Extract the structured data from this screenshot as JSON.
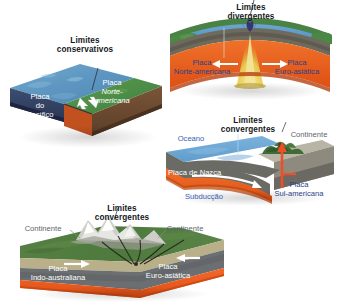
{
  "figure": {
    "title_text": "Tipos de limites de placas tectónicas",
    "background": "#ffffff"
  },
  "panels": [
    {
      "id": "conservative",
      "name": "conservative-boundary-block",
      "title_line1": "Limites",
      "title_line2": "conservativos",
      "labels": [
        {
          "name": "plate-label-pacific",
          "text": "Placa",
          "style": "white"
        },
        {
          "name": "plate-label-pacific-2",
          "text": "do",
          "style": "white"
        },
        {
          "name": "plate-label-pacific-3",
          "text": "Pacífico",
          "style": "white"
        },
        {
          "name": "plate-label-north-american",
          "text": "Placa",
          "style": "white"
        },
        {
          "name": "plate-label-north-american-2",
          "text": "Norte-",
          "style": "white-italic"
        },
        {
          "name": "plate-label-north-american-3",
          "text": "americana",
          "style": "white-italic"
        }
      ],
      "colors": {
        "ocean": "#5d97c2",
        "land": "#4f8f4a",
        "mantle": "#2e3a5c",
        "crust": "#6b4a32",
        "magma": "#d4561f"
      }
    },
    {
      "id": "divergent",
      "name": "divergent-boundary-block",
      "title_line1": "Limites",
      "title_line2": "divergentes",
      "labels": [
        {
          "name": "plate-label-north-american",
          "text": "Placa",
          "style": "blue"
        },
        {
          "name": "plate-label-north-american-2",
          "text": "Norte-americana",
          "style": "blue"
        },
        {
          "name": "plate-label-euro-asian",
          "text": "Placa",
          "style": "blue"
        },
        {
          "name": "plate-label-euro-asian-2",
          "text": "Euro-asiática",
          "style": "blue"
        }
      ],
      "arrows": [
        "arrow-left",
        "arrow-right"
      ],
      "colors": {
        "ocean": "#5f9ecb",
        "land": "#4a8246",
        "mantle": "#6e6a5c",
        "asthenosphere": "#e8611e",
        "magma": "#e8d15a"
      }
    },
    {
      "id": "convergent-ocean",
      "name": "convergent-ocean-continent-block",
      "title_line1": "Limites",
      "title_line2": "convergentes",
      "labels": [
        {
          "name": "label-ocean",
          "text": "Oceano",
          "style": "blue-light"
        },
        {
          "name": "label-continent",
          "text": "Continente",
          "style": "gray"
        },
        {
          "name": "plate-label-nazca",
          "text": "Placa de Nazca",
          "style": "white"
        },
        {
          "name": "label-subduction",
          "text": "Subducção",
          "style": "blue-light"
        },
        {
          "name": "plate-label-south-american",
          "text": "Placa",
          "style": "blue"
        },
        {
          "name": "plate-label-south-american-2",
          "text": "Sul-americana",
          "style": "blue"
        }
      ],
      "colors": {
        "ocean": "#6fa8d6",
        "continent": "#b8b4a6",
        "mantle": "#6b6b66",
        "asthenosphere": "#e8611e",
        "arrow": "#ef4f28"
      }
    },
    {
      "id": "convergent-continent",
      "name": "convergent-continent-continent-block",
      "title_line1": "Limites",
      "title_line2": "convergentes",
      "labels": [
        {
          "name": "label-continent-left",
          "text": "Continente",
          "style": "gray"
        },
        {
          "name": "label-continent-right",
          "text": "Continente",
          "style": "gray"
        },
        {
          "name": "plate-label-indo-australian",
          "text": "Placa",
          "style": "white"
        },
        {
          "name": "plate-label-indo-australian-2",
          "text": "Indo-australiana",
          "style": "white"
        },
        {
          "name": "plate-label-euro-asian",
          "text": "Placa",
          "style": "white"
        },
        {
          "name": "plate-label-euro-asian-2",
          "text": "Euro-asiática",
          "style": "white"
        }
      ],
      "colors": {
        "land": "#4e7a3e",
        "sediment": "#b9b089",
        "mantle": "#6b6f72",
        "asthenosphere": "#ef5a1e",
        "mountains": "#c9c9c4"
      }
    }
  ]
}
